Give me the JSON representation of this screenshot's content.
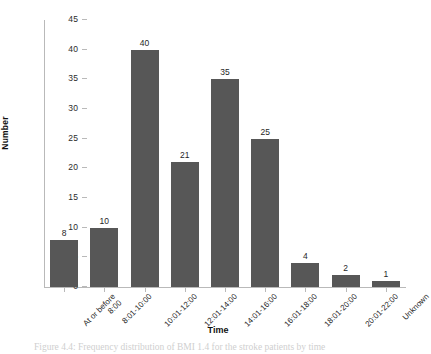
{
  "chart_data": {
    "type": "bar",
    "title": "",
    "xlabel": "Time",
    "ylabel": "Number",
    "ylim": [
      0,
      45
    ],
    "yticks": [
      0,
      5,
      10,
      15,
      20,
      25,
      30,
      35,
      40,
      45
    ],
    "grid": false,
    "legend": null,
    "bar_color": "#575757",
    "categories": [
      "At or before 8:00",
      "8:01-10:00",
      "10:01-12:00",
      "12:01-14:00",
      "14:01-16:00",
      "16:01-18:00",
      "18:01-20:00",
      "20:01-22:00",
      "Unknown"
    ],
    "category_lines": [
      [
        "At or before",
        "8:00"
      ],
      [
        "8:01-10:00"
      ],
      [
        "10:01-12:00"
      ],
      [
        "12:01-14:00"
      ],
      [
        "14:01-16:00"
      ],
      [
        "16:01-18:00"
      ],
      [
        "18:01-20:00"
      ],
      [
        "20:01-22:00"
      ],
      [
        "Unknown"
      ]
    ],
    "values": [
      8,
      10,
      40,
      21,
      35,
      25,
      4,
      2,
      1
    ],
    "data_labels": [
      "8",
      "10",
      "40",
      "21",
      "35",
      "25",
      "4",
      "2",
      "1"
    ]
  },
  "caption": {
    "text": "Figure 4.4: Frequency distribution of BMI 1.4 for the stroke patients by time"
  }
}
